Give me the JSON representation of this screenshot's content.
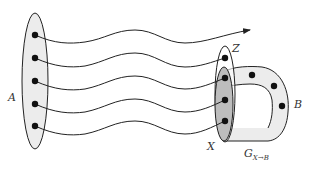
{
  "diagram": {
    "type": "set-mapping-illustration",
    "colors": {
      "stroke": "#222222",
      "set_fill_light": "#ececec",
      "set_fill_dark": "#bdbdbd",
      "dot": "#111111",
      "label": "#333333"
    },
    "sets": {
      "A": {
        "label": "A",
        "dot_count": 5
      },
      "Z": {
        "label": "Z",
        "dot_count": 1
      },
      "X": {
        "label": "X",
        "dot_count": 4
      },
      "B": {
        "label": "B",
        "dot_count": 3
      }
    },
    "graph_label": {
      "base": "G",
      "subscript": "X→B"
    },
    "paths": [
      {
        "from": "A",
        "to": "beyond",
        "arrow": true
      },
      {
        "from": "A",
        "to": "Z",
        "arrow": false
      },
      {
        "from": "A",
        "to": "X",
        "arrow": false
      },
      {
        "from": "A",
        "to": "X",
        "arrow": false
      },
      {
        "from": "A",
        "to": "X",
        "arrow": false
      }
    ]
  }
}
